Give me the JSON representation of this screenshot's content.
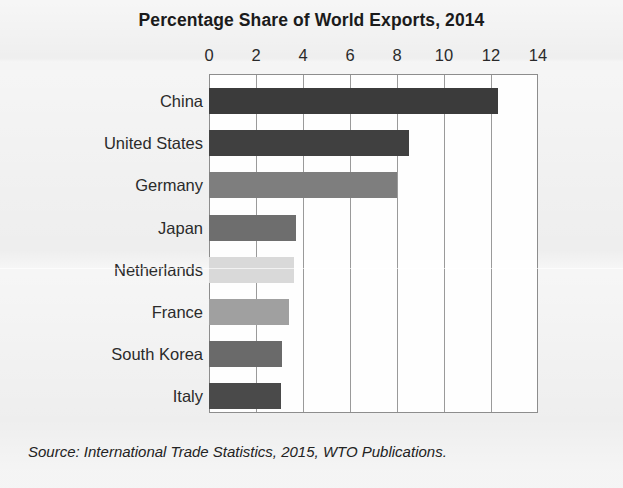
{
  "chart_data": {
    "type": "bar",
    "orientation": "horizontal",
    "title": "Percentage Share of World Exports, 2014",
    "xlabel": "",
    "ylabel": "",
    "xlim": [
      0,
      14
    ],
    "xticks": [
      0,
      2,
      4,
      6,
      8,
      10,
      12,
      14
    ],
    "xtick_labels": [
      "0",
      "2",
      "4",
      "6",
      "8",
      "10",
      "12",
      "14"
    ],
    "grid": "vertical",
    "legend": "none",
    "categories": [
      "China",
      "United States",
      "Germany",
      "Japan",
      "Netherlands",
      "France",
      "South Korea",
      "Italy"
    ],
    "values": [
      12.3,
      8.5,
      8.0,
      3.7,
      3.6,
      3.4,
      3.1,
      3.05
    ],
    "bar_colors": [
      "#3b3b3b",
      "#404040",
      "#7e7e7e",
      "#6e6e6e",
      "#d9d9d9",
      "#a0a0a0",
      "#6a6a6a",
      "#4a4a4a"
    ],
    "bars": [
      {
        "label": "China",
        "value": 12.3,
        "color": "#3b3b3b"
      },
      {
        "label": "United States",
        "value": 8.5,
        "color": "#404040"
      },
      {
        "label": "Germany",
        "value": 8.0,
        "color": "#7e7e7e"
      },
      {
        "label": "Japan",
        "value": 3.7,
        "color": "#6e6e6e"
      },
      {
        "label": "Netherlands",
        "value": 3.6,
        "color": "#d9d9d9"
      },
      {
        "label": "France",
        "value": 3.4,
        "color": "#a0a0a0"
      },
      {
        "label": "South Korea",
        "value": 3.1,
        "color": "#6a6a6a"
      },
      {
        "label": "Italy",
        "value": 3.05,
        "color": "#4a4a4a"
      }
    ]
  },
  "source": {
    "text": "Source: International Trade Statistics, 2015, WTO Publications."
  },
  "colors": {
    "page_background": "#ececec",
    "plot_background": "#fefefe",
    "gridline": "#9a9a9a",
    "axis_border": "#8d8d8d",
    "title_text": "#1b1b1b",
    "label_text": "#2b2b2b"
  }
}
